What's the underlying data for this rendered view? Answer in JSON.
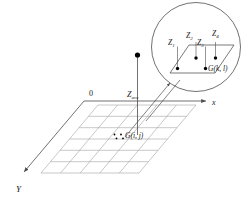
{
  "figure": {
    "background_color": "#ffffff",
    "line_color": "#8c8c8c",
    "axis_color": "#4d4d4d",
    "text_color": "#1a1a1a",
    "dot_color": "#000000"
  },
  "axes": {
    "origin_label": "0",
    "x_label": "x",
    "y_label": "Y",
    "z_label": "Z",
    "z_sub": "ave"
  },
  "grid": {
    "columns": 5,
    "rows": 6,
    "cell_label": "G",
    "cell_label_indices": "(i, j)",
    "cell_label_full": "G(i, j)"
  },
  "inset": {
    "shape": "circle",
    "cell_label": "G",
    "cell_label_indices": "(k, l)",
    "cell_label_full": "G(k, l)",
    "corner_points": [
      {
        "id": "z1",
        "label": "Z",
        "sub": "1"
      },
      {
        "id": "z2",
        "label": "Z",
        "sub": "2"
      },
      {
        "id": "z3",
        "label": "Z",
        "sub": "3"
      },
      {
        "id": "z4",
        "label": "Z",
        "sub": "4"
      }
    ]
  }
}
